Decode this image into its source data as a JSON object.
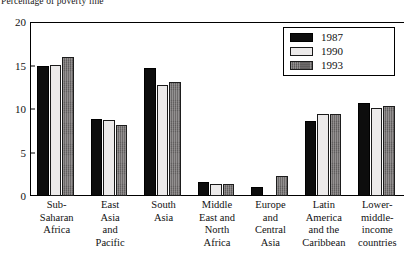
{
  "axis_title": "Percentage of poverty line",
  "legend": {
    "position": "top-right",
    "entries": [
      {
        "label": "1987",
        "color": "#0d0d0d",
        "swatch": "legend-swatch-1987"
      },
      {
        "label": "1990",
        "color": "#eceaea",
        "swatch": "legend-swatch-1990"
      },
      {
        "label": "1993",
        "color": "#6e6b6b",
        "swatch": "legend-swatch-1993"
      }
    ]
  },
  "yaxis": {
    "ticks": [
      "0",
      "5",
      "10",
      "15",
      "20"
    ],
    "min": 0,
    "max": 20
  },
  "categories_wrapped": [
    [
      "Sub-",
      "Saharan",
      "Africa"
    ],
    [
      "East",
      "Asia",
      "and",
      "Pacific"
    ],
    [
      "South",
      "Asia"
    ],
    [
      "Middle",
      "East and",
      "North",
      "Africa"
    ],
    [
      "Europe",
      "and",
      "Central",
      "Asia"
    ],
    [
      "Latin",
      "America",
      "and the",
      "Caribbean"
    ],
    [
      "Lower-",
      "middle-",
      "income",
      "countries"
    ]
  ],
  "chart_data": {
    "type": "bar",
    "title": "Percentage of poverty line",
    "xlabel": "",
    "ylabel": "Percentage of poverty line",
    "ylim": [
      0,
      20
    ],
    "yticks": [
      0,
      5,
      10,
      15,
      20
    ],
    "grid": false,
    "legend_position": "top-right",
    "categories": [
      "Sub-Saharan Africa",
      "East Asia and Pacific",
      "South Asia",
      "Middle East and North Africa",
      "Europe and Central Asia",
      "Latin America and the Caribbean",
      "Lower-middle-income countries"
    ],
    "series": [
      {
        "name": "1987",
        "color": "#0d0d0d",
        "values": [
          15.0,
          8.8,
          14.7,
          1.6,
          1.0,
          8.6,
          10.7
        ]
      },
      {
        "name": "1990",
        "color": "#eceaea",
        "values": [
          15.1,
          8.7,
          12.8,
          1.4,
          0.0,
          9.4,
          10.1
        ]
      },
      {
        "name": "1993",
        "color": "#6e6b6b",
        "values": [
          16.0,
          8.2,
          13.1,
          1.4,
          2.3,
          9.4,
          10.4
        ]
      }
    ]
  }
}
